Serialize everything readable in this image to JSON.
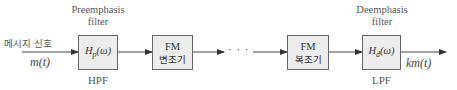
{
  "input": {
    "label": "메시지 신호",
    "signal": "m(t)"
  },
  "blocks": [
    {
      "top_label_1": "Preemphasis",
      "top_label_2": "filter",
      "function_main": "H",
      "function_sub": "p",
      "function_arg": "(ω)",
      "bottom_label": "HPF"
    },
    {
      "line1": "FM",
      "line2": "변조기"
    },
    {
      "line1": "FM",
      "line2": "복조기"
    },
    {
      "top_label_1": "Deemphasis",
      "top_label_2": "filter",
      "function_main": "H",
      "function_sub": "d",
      "function_arg": "(ω)",
      "bottom_label": "LPF"
    }
  ],
  "ellipsis": "· · ·",
  "output": {
    "signal": "km(t)"
  },
  "colors": {
    "box_fill": "#ececec",
    "line": "#444444"
  }
}
